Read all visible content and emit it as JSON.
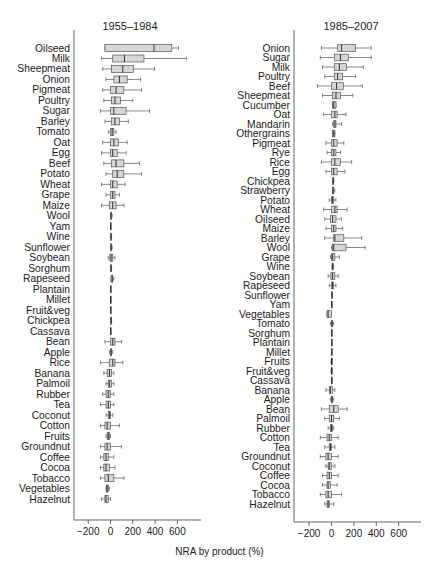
{
  "chart_data": [
    {
      "type": "boxplot",
      "title": "1955–1984",
      "xlabel": "NRA by product (%)",
      "xlim": [
        -300,
        800
      ],
      "xticks": [
        -200,
        0,
        200,
        400,
        600
      ],
      "grid": false,
      "orientation": "horizontal",
      "columns": [
        "category",
        "whisker_low",
        "q1",
        "median",
        "q3",
        "whisker_high"
      ],
      "rows": [
        [
          "Oilseed",
          -50,
          -50,
          390,
          550,
          610
        ],
        [
          "Milk",
          -80,
          20,
          125,
          300,
          680
        ],
        [
          "Sheepmeat",
          -70,
          10,
          110,
          205,
          395
        ],
        [
          "Onion",
          -40,
          30,
          80,
          150,
          270
        ],
        [
          "Pigmeat",
          -70,
          0,
          50,
          120,
          280
        ],
        [
          "Poultry",
          -60,
          10,
          40,
          90,
          200
        ],
        [
          "Sugar",
          -90,
          0,
          30,
          140,
          350
        ],
        [
          "Barley",
          -50,
          10,
          40,
          80,
          160
        ],
        [
          "Tomato",
          -20,
          0,
          15,
          30,
          50
        ],
        [
          "Oat",
          -70,
          0,
          30,
          70,
          150
        ],
        [
          "Egg",
          -80,
          0,
          20,
          60,
          140
        ],
        [
          "Beef",
          -60,
          10,
          50,
          120,
          260
        ],
        [
          "Potato",
          -40,
          20,
          60,
          120,
          280
        ],
        [
          "Wheat",
          -80,
          0,
          20,
          60,
          130
        ],
        [
          "Grape",
          -40,
          0,
          20,
          40,
          80
        ],
        [
          "Maize",
          -80,
          -10,
          20,
          50,
          120
        ],
        [
          "Wool",
          0,
          0,
          5,
          10,
          15
        ],
        [
          "Yam",
          0,
          0,
          0,
          0,
          0
        ],
        [
          "Wine",
          0,
          0,
          5,
          5,
          10
        ],
        [
          "Sunflower",
          0,
          0,
          5,
          10,
          15
        ],
        [
          "Soybean",
          -20,
          -5,
          5,
          20,
          40
        ],
        [
          "Sorghum",
          0,
          0,
          5,
          5,
          10
        ],
        [
          "Rapeseed",
          5,
          5,
          15,
          20,
          30
        ],
        [
          "Plantain",
          0,
          0,
          0,
          0,
          0
        ],
        [
          "Millet",
          0,
          0,
          0,
          0,
          0
        ],
        [
          "Fruit&veg",
          0,
          0,
          0,
          0,
          0
        ],
        [
          "Chickpea",
          0,
          0,
          5,
          5,
          10
        ],
        [
          "Cassava",
          0,
          0,
          0,
          0,
          0
        ],
        [
          "Bean",
          -50,
          0,
          20,
          40,
          100
        ],
        [
          "Apple",
          -10,
          0,
          5,
          10,
          20
        ],
        [
          "Rice",
          -90,
          -10,
          20,
          40,
          110
        ],
        [
          "Banana",
          -60,
          -30,
          -10,
          10,
          30
        ],
        [
          "Palmoil",
          -40,
          -20,
          -10,
          10,
          30
        ],
        [
          "Rubber",
          -70,
          -40,
          -20,
          0,
          30
        ],
        [
          "Tea",
          -90,
          -40,
          -20,
          0,
          30
        ],
        [
          "Coconut",
          -40,
          -20,
          -10,
          0,
          20
        ],
        [
          "Cotton",
          -90,
          -50,
          -30,
          0,
          80
        ],
        [
          "Fruits",
          -40,
          -30,
          -20,
          -10,
          0
        ],
        [
          "Groundnut",
          -90,
          -50,
          -30,
          0,
          100
        ],
        [
          "Coffee",
          -90,
          -60,
          -40,
          -20,
          30
        ],
        [
          "Cocoa",
          -90,
          -60,
          -40,
          -10,
          40
        ],
        [
          "Tobacco",
          -90,
          -50,
          -20,
          30,
          120
        ],
        [
          "Vegetables",
          -40,
          -35,
          -30,
          -20,
          -10
        ],
        [
          "Hazelnut",
          -80,
          -50,
          -40,
          -20,
          0
        ]
      ]
    },
    {
      "type": "boxplot",
      "title": "1985–2007",
      "xlabel": "NRA by product (%)",
      "xlim": [
        -300,
        800
      ],
      "xticks": [
        -200,
        0,
        200,
        400,
        600
      ],
      "grid": false,
      "orientation": "horizontal",
      "columns": [
        "category",
        "whisker_low",
        "q1",
        "median",
        "q3",
        "whisker_high"
      ],
      "rows": [
        [
          "Onion",
          -90,
          55,
          90,
          215,
          355
        ],
        [
          "Sugar",
          -100,
          25,
          80,
          150,
          355
        ],
        [
          "Milk",
          -80,
          25,
          70,
          135,
          285
        ],
        [
          "Poultry",
          -60,
          25,
          55,
          100,
          215
        ],
        [
          "Beef",
          -125,
          0,
          45,
          105,
          275
        ],
        [
          "Sheepmeat",
          -80,
          10,
          40,
          80,
          190
        ],
        [
          "Cucumber",
          10,
          10,
          20,
          40,
          40
        ],
        [
          "Oat",
          -70,
          0,
          30,
          50,
          130
        ],
        [
          "Mandarin",
          10,
          20,
          30,
          40,
          90
        ],
        [
          "Othergrains",
          10,
          10,
          20,
          30,
          30
        ],
        [
          "Pigmeat",
          -50,
          0,
          20,
          50,
          110
        ],
        [
          "Rye",
          -40,
          0,
          20,
          40,
          80
        ],
        [
          "Rice",
          -90,
          0,
          30,
          80,
          180
        ],
        [
          "Egg",
          -50,
          0,
          20,
          50,
          120
        ],
        [
          "Chickpea",
          10,
          10,
          15,
          20,
          20
        ],
        [
          "Strawberry",
          10,
          10,
          15,
          20,
          30
        ],
        [
          "Potato",
          -20,
          0,
          10,
          20,
          40
        ],
        [
          "Wheat",
          -70,
          0,
          30,
          50,
          140
        ],
        [
          "Oilseed",
          -60,
          -10,
          10,
          40,
          90
        ],
        [
          "Maize",
          -50,
          0,
          20,
          40,
          100
        ],
        [
          "Barley",
          -60,
          20,
          30,
          110,
          270
        ],
        [
          "Wool",
          0,
          10,
          20,
          130,
          300
        ],
        [
          "Grape",
          -10,
          0,
          10,
          30,
          70
        ],
        [
          "Wine",
          5,
          5,
          10,
          15,
          20
        ],
        [
          "Soybean",
          -30,
          -5,
          10,
          30,
          60
        ],
        [
          "Rapeseed",
          -20,
          0,
          10,
          20,
          40
        ],
        [
          "Sunflower",
          0,
          0,
          5,
          10,
          10
        ],
        [
          "Yam",
          0,
          0,
          0,
          0,
          0
        ],
        [
          "Vegetables",
          -40,
          -40,
          -30,
          0,
          0
        ],
        [
          "Tomato",
          -10,
          0,
          5,
          10,
          20
        ],
        [
          "Sorghum",
          0,
          0,
          0,
          0,
          0
        ],
        [
          "Plantain",
          0,
          0,
          0,
          0,
          0
        ],
        [
          "Millet",
          0,
          0,
          0,
          0,
          0
        ],
        [
          "Fruits",
          -5,
          0,
          0,
          5,
          5
        ],
        [
          "Fruit&veg",
          -5,
          0,
          0,
          5,
          5
        ],
        [
          "Cassava",
          0,
          0,
          0,
          0,
          0
        ],
        [
          "Banana",
          -50,
          -20,
          -10,
          10,
          30
        ],
        [
          "Apple",
          -10,
          0,
          5,
          10,
          20
        ],
        [
          "Bean",
          -90,
          -20,
          20,
          60,
          140
        ],
        [
          "Palmoil",
          -60,
          -20,
          0,
          20,
          70
        ],
        [
          "Rubber",
          -30,
          -10,
          0,
          10,
          20
        ],
        [
          "Cotton",
          -100,
          -40,
          -20,
          0,
          60
        ],
        [
          "Tea",
          -60,
          -20,
          -10,
          0,
          30
        ],
        [
          "Groundnut",
          -100,
          -50,
          -30,
          0,
          60
        ],
        [
          "Coconut",
          -50,
          -30,
          -20,
          0,
          30
        ],
        [
          "Coffee",
          -80,
          -40,
          -20,
          0,
          60
        ],
        [
          "Cocoa",
          -80,
          -40,
          -30,
          -10,
          50
        ],
        [
          "Tobacco",
          -100,
          -50,
          -30,
          0,
          90
        ],
        [
          "Hazelnut",
          -60,
          -40,
          -30,
          -20,
          20
        ]
      ]
    }
  ],
  "figure": {
    "shared_xlabel": "NRA by product (%)",
    "box_fill": "#d6d6d6",
    "line_color": "#555555"
  }
}
